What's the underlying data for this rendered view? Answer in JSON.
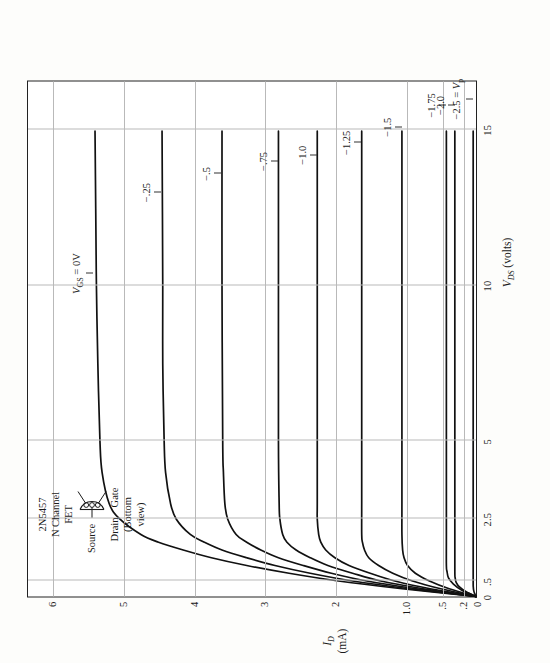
{
  "figure": {
    "device_box": {
      "line1": "2N5457",
      "line2": "N Channel",
      "line3": "FET",
      "source_label": "Source",
      "drain_label": "Drain",
      "gate_label": "Gate",
      "view_line1": "(Bottom",
      "view_line2": "view)",
      "package_icon": "to92-pinout-icon"
    },
    "axes": {
      "x_title_sym": "V",
      "x_title_sub": "DS",
      "x_title_unit": "(volts)",
      "y_title_sym": "I",
      "y_title_sub": "D",
      "y_title_unit": "(mA)",
      "x_ticks": [
        {
          "label": "0",
          "value": 0
        },
        {
          "label": ".5",
          "value": 0.5
        },
        {
          "label": "2.5",
          "value": 2.5
        },
        {
          "label": "5",
          "value": 5
        },
        {
          "label": "10",
          "value": 10
        },
        {
          "label": "15",
          "value": 15
        }
      ],
      "y_ticks": [
        {
          "label": "0",
          "value": 0
        },
        {
          "label": ".2",
          "value": 0.2
        },
        {
          "label": ".5",
          "value": 0.5
        },
        {
          "label": "1.0",
          "value": 1.0
        },
        {
          "label": "2",
          "value": 2
        },
        {
          "label": "3",
          "value": 3
        },
        {
          "label": "4",
          "value": 4
        },
        {
          "label": "5",
          "value": 5
        },
        {
          "label": "6",
          "value": 6
        }
      ],
      "xlim": [
        0,
        16.6
      ],
      "ylim": [
        0,
        6.35
      ],
      "grid": true
    },
    "curve_labels": [
      {
        "text": "VGS = 0V",
        "id": "vgs-0"
      },
      {
        "text": "-.25",
        "id": "vgs-m025"
      },
      {
        "text": "-.5",
        "id": "vgs-m05"
      },
      {
        "text": "-.75",
        "id": "vgs-m075"
      },
      {
        "text": "-1.0",
        "id": "vgs-m10"
      },
      {
        "text": "-1.25",
        "id": "vgs-m125"
      },
      {
        "text": "-1.5",
        "id": "vgs-m15"
      },
      {
        "text": "-1.75",
        "id": "vgs-m175"
      },
      {
        "text": "-2.0",
        "id": "vgs-m20"
      },
      {
        "text": "-2.5 = Vp",
        "id": "vgs-m25-vp"
      }
    ]
  },
  "chart_data": {
    "type": "line",
    "xlabel": "V_DS (volts)",
    "ylabel": "I_D (mA)",
    "xlim": [
      0,
      16.6
    ],
    "ylim": [
      0,
      6.35
    ],
    "xticks": [
      0,
      0.5,
      2.5,
      5,
      10,
      15
    ],
    "xticklabels": [
      "0",
      ".5",
      "2.5",
      "5",
      "10",
      "15"
    ],
    "yticks": [
      0,
      0.2,
      0.5,
      1.0,
      2,
      3,
      4,
      5,
      6
    ],
    "yticklabels": [
      "0",
      ".2",
      ".5",
      "1.0",
      "2",
      "3",
      "4",
      "5",
      "6"
    ],
    "grid": true,
    "legend": "inline curve annotations",
    "series": [
      {
        "name": "VGS = 0V",
        "vgs": 0.0,
        "idss_sat": 5.4,
        "knee_vds": 2.5,
        "points": [
          [
            0,
            0
          ],
          [
            0.25,
            1.05
          ],
          [
            0.5,
            1.95
          ],
          [
            0.75,
            2.65
          ],
          [
            1.0,
            3.25
          ],
          [
            1.25,
            3.75
          ],
          [
            1.5,
            4.15
          ],
          [
            1.75,
            4.5
          ],
          [
            2.0,
            4.75
          ],
          [
            2.5,
            5.05
          ],
          [
            3.0,
            5.2
          ],
          [
            4.0,
            5.3
          ],
          [
            5.0,
            5.33
          ],
          [
            7.5,
            5.36
          ],
          [
            10,
            5.38
          ],
          [
            12.5,
            5.39
          ],
          [
            15,
            5.4
          ]
        ]
      },
      {
        "name": "-.25",
        "vgs": -0.25,
        "idss_sat": 4.45,
        "knee_vds": 2.25,
        "points": [
          [
            0,
            0
          ],
          [
            0.25,
            0.95
          ],
          [
            0.5,
            1.75
          ],
          [
            0.75,
            2.35
          ],
          [
            1.0,
            2.85
          ],
          [
            1.25,
            3.25
          ],
          [
            1.5,
            3.6
          ],
          [
            1.75,
            3.85
          ],
          [
            2.0,
            4.05
          ],
          [
            2.5,
            4.25
          ],
          [
            3.0,
            4.33
          ],
          [
            4.0,
            4.4
          ],
          [
            5.0,
            4.42
          ],
          [
            7.5,
            4.44
          ],
          [
            10,
            4.44
          ],
          [
            15,
            4.45
          ]
        ]
      },
      {
        "name": "-.5",
        "vgs": -0.5,
        "idss_sat": 3.6,
        "knee_vds": 2.0,
        "points": [
          [
            0,
            0
          ],
          [
            0.25,
            0.85
          ],
          [
            0.5,
            1.55
          ],
          [
            0.75,
            2.05
          ],
          [
            1.0,
            2.45
          ],
          [
            1.25,
            2.8
          ],
          [
            1.5,
            3.05
          ],
          [
            1.75,
            3.25
          ],
          [
            2.0,
            3.4
          ],
          [
            2.5,
            3.52
          ],
          [
            3.0,
            3.56
          ],
          [
            4.0,
            3.58
          ],
          [
            5.0,
            3.59
          ],
          [
            10,
            3.6
          ],
          [
            15,
            3.6
          ]
        ]
      },
      {
        "name": "-.75",
        "vgs": -0.75,
        "idss_sat": 2.8,
        "knee_vds": 1.75,
        "points": [
          [
            0,
            0
          ],
          [
            0.25,
            0.75
          ],
          [
            0.5,
            1.35
          ],
          [
            0.75,
            1.75
          ],
          [
            1.0,
            2.1
          ],
          [
            1.25,
            2.35
          ],
          [
            1.5,
            2.55
          ],
          [
            1.75,
            2.68
          ],
          [
            2.0,
            2.74
          ],
          [
            2.5,
            2.78
          ],
          [
            3.0,
            2.79
          ],
          [
            5.0,
            2.8
          ],
          [
            10,
            2.8
          ],
          [
            15,
            2.8
          ]
        ]
      },
      {
        "name": "-1.0",
        "vgs": -1.0,
        "idss_sat": 2.25,
        "knee_vds": 1.5,
        "points": [
          [
            0,
            0
          ],
          [
            0.25,
            0.65
          ],
          [
            0.5,
            1.15
          ],
          [
            0.75,
            1.5
          ],
          [
            1.0,
            1.8
          ],
          [
            1.25,
            2.0
          ],
          [
            1.5,
            2.13
          ],
          [
            1.75,
            2.2
          ],
          [
            2.0,
            2.23
          ],
          [
            2.5,
            2.25
          ],
          [
            3.0,
            2.25
          ],
          [
            5.0,
            2.25
          ],
          [
            10,
            2.25
          ],
          [
            15,
            2.25
          ]
        ]
      },
      {
        "name": "-1.25",
        "vgs": -1.25,
        "idss_sat": 1.62,
        "knee_vds": 1.25,
        "points": [
          [
            0,
            0
          ],
          [
            0.25,
            0.5
          ],
          [
            0.5,
            0.9
          ],
          [
            0.75,
            1.18
          ],
          [
            1.0,
            1.38
          ],
          [
            1.25,
            1.52
          ],
          [
            1.5,
            1.58
          ],
          [
            1.75,
            1.61
          ],
          [
            2.0,
            1.62
          ],
          [
            3.0,
            1.62
          ],
          [
            5.0,
            1.62
          ],
          [
            10,
            1.62
          ],
          [
            15,
            1.62
          ]
        ]
      },
      {
        "name": "-1.5",
        "vgs": -1.5,
        "idss_sat": 1.05,
        "knee_vds": 1.0,
        "points": [
          [
            0,
            0
          ],
          [
            0.25,
            0.38
          ],
          [
            0.5,
            0.66
          ],
          [
            0.75,
            0.86
          ],
          [
            1.0,
            0.97
          ],
          [
            1.25,
            1.02
          ],
          [
            1.5,
            1.04
          ],
          [
            2.0,
            1.05
          ],
          [
            3.0,
            1.05
          ],
          [
            5.0,
            1.05
          ],
          [
            10,
            1.05
          ],
          [
            15,
            1.05
          ]
        ]
      },
      {
        "name": "-1.75",
        "vgs": -1.75,
        "idss_sat": 0.42,
        "knee_vds": 0.7,
        "points": [
          [
            0,
            0
          ],
          [
            0.2,
            0.2
          ],
          [
            0.4,
            0.32
          ],
          [
            0.6,
            0.39
          ],
          [
            0.8,
            0.41
          ],
          [
            1.0,
            0.42
          ],
          [
            2.0,
            0.42
          ],
          [
            5.0,
            0.42
          ],
          [
            10,
            0.42
          ],
          [
            15,
            0.42
          ]
        ]
      },
      {
        "name": "-2.0",
        "vgs": -2.0,
        "idss_sat": 0.3,
        "knee_vds": 0.55,
        "points": [
          [
            0,
            0
          ],
          [
            0.15,
            0.14
          ],
          [
            0.3,
            0.23
          ],
          [
            0.45,
            0.28
          ],
          [
            0.6,
            0.295
          ],
          [
            0.8,
            0.3
          ],
          [
            2.0,
            0.3
          ],
          [
            5.0,
            0.3
          ],
          [
            10,
            0.3
          ],
          [
            15,
            0.3
          ]
        ]
      },
      {
        "name": "-2.5 = Vp",
        "vgs": -2.5,
        "idss_sat": 0.04,
        "knee_vds": 0.3,
        "points": [
          [
            0,
            0
          ],
          [
            0.1,
            0.02
          ],
          [
            0.2,
            0.033
          ],
          [
            0.3,
            0.038
          ],
          [
            0.5,
            0.04
          ],
          [
            2.0,
            0.04
          ],
          [
            5.0,
            0.04
          ],
          [
            10,
            0.04
          ],
          [
            15,
            0.04
          ]
        ]
      }
    ],
    "curve_label_positions": [
      {
        "name": "VGS = 0V",
        "vds": 10.4,
        "id": 5.4
      },
      {
        "name": "-.25",
        "vds": 13.0,
        "id": 4.45
      },
      {
        "name": "-.5",
        "vds": 13.6,
        "id": 3.6
      },
      {
        "name": "-.75",
        "vds": 14.0,
        "id": 2.8
      },
      {
        "name": "-1.0",
        "vds": 14.2,
        "id": 2.25
      },
      {
        "name": "-1.25",
        "vds": 14.6,
        "id": 1.62
      },
      {
        "name": "-1.5",
        "vds": 15.1,
        "id": 1.05
      },
      {
        "name": "-1.75",
        "vds": 15.8,
        "id": 0.42
      },
      {
        "name": "-2.0",
        "vds": 15.8,
        "id": 0.3
      },
      {
        "name": "-2.5 = Vp",
        "vds": 16.0,
        "id": 0.04
      }
    ]
  }
}
